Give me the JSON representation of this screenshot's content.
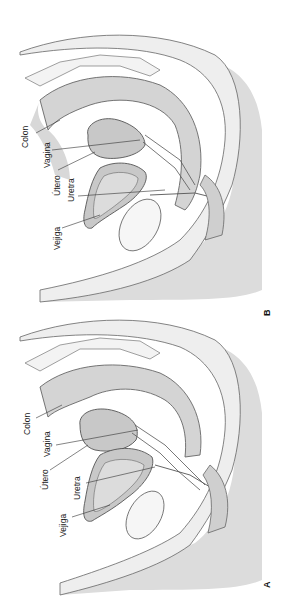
{
  "figure": {
    "panels": [
      {
        "id": "B",
        "letter": "B",
        "labels": {
          "colon": "Colon",
          "vagina": "Vagina",
          "utero": "Útero",
          "uretra": "Uretra",
          "vejiga": "Vejiga"
        }
      },
      {
        "id": "A",
        "letter": "A",
        "labels": {
          "colon": "Colon",
          "vagina": "Vagina",
          "utero": "Útero",
          "uretra": "Uretra",
          "vejiga": "Vejiga"
        }
      }
    ],
    "colors": {
      "background": "#ffffff",
      "tissue_light": "#ececec",
      "tissue_mid": "#dcdcdc",
      "organ_fill": "#c8c8c8",
      "outline": "#555555"
    }
  }
}
